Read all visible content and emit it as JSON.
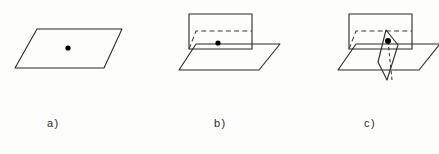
{
  "figure": {
    "caption_labels": [
      {
        "key": "a",
        "text": "a)"
      },
      {
        "key": "b",
        "text": "b)"
      },
      {
        "key": "c",
        "text": "c)"
      }
    ],
    "background_color": "#fdfdfc",
    "stroke_color": "#2b2b2b",
    "dashed_stroke_color": "#3a3a3a",
    "point_color": "#000000",
    "panels": [
      {
        "id": "a",
        "label": "a)",
        "description": "single plane with one marked point",
        "plane_count": 1,
        "point_count": 1,
        "planes": [
          {
            "name": "horizontal-plane",
            "style": "solid",
            "points": "37,29 122,29 104,68 15,68"
          }
        ],
        "points": [
          {
            "name": "center-point",
            "cx": 68,
            "cy": 48,
            "r": 2.6
          }
        ],
        "hidden_edges": []
      },
      {
        "id": "b",
        "label": "b)",
        "description": "two intersecting planes with a marked point on the line of intersection",
        "plane_count": 2,
        "point_count": 1,
        "planes": [
          {
            "name": "horizontal-plane",
            "style": "solid",
            "points": "196,44 280,44 259,70 179,70"
          },
          {
            "name": "vertical-plane",
            "style": "solid",
            "points": "189,14 252,14 252,49 189,49"
          }
        ],
        "points": [
          {
            "name": "intersection-point",
            "cx": 218,
            "cy": 43,
            "r": 2.6
          }
        ],
        "hidden_edges": [
          {
            "name": "hidden-intersection-line",
            "style": "dashed",
            "points": "189,49 196,31 252,31"
          }
        ]
      },
      {
        "id": "c",
        "label": "c)",
        "description": "three intersecting planes meeting in a single common point",
        "plane_count": 3,
        "point_count": 1,
        "planes": [
          {
            "name": "horizontal-plane",
            "style": "solid",
            "points": "356,44 440,44 419,70 338,70"
          },
          {
            "name": "vertical-plane",
            "style": "solid",
            "points": "349,14 412,14 412,49 349,49"
          },
          {
            "name": "slanted-sliver-plane",
            "style": "solid",
            "points": "386,30 398,45 387,80 378,62"
          }
        ],
        "points": [
          {
            "name": "common-point",
            "cx": 388,
            "cy": 41,
            "r": 3.0
          }
        ],
        "hidden_edges": [
          {
            "name": "hidden-intersection-line",
            "style": "dashed",
            "points": "349,49 356,31 412,31"
          },
          {
            "name": "hidden-sliver-edge",
            "style": "dashed",
            "points": "388,41 392,80"
          },
          {
            "name": "hidden-sliver-top-edge",
            "style": "dashed",
            "points": "386,30 388,41"
          }
        ]
      }
    ]
  }
}
